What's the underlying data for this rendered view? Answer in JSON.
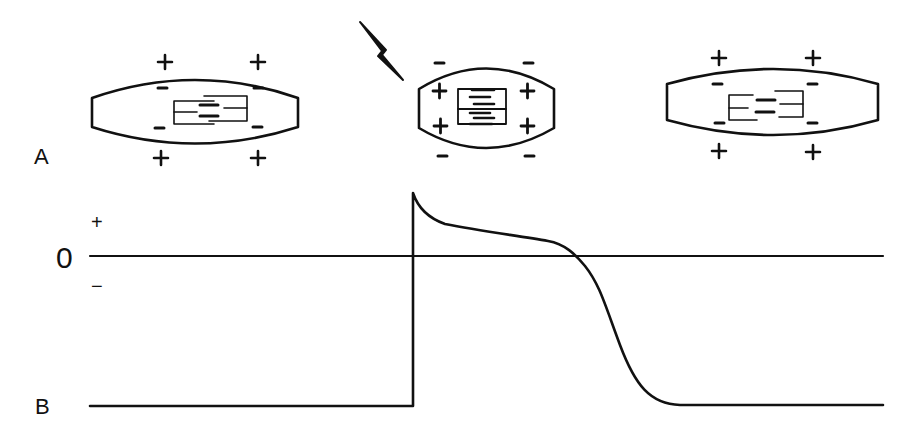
{
  "panels": {
    "a_label": "A",
    "b_label": "B"
  },
  "axis": {
    "zero_label": "0",
    "plus_label": "+",
    "minus_label": "−"
  },
  "cells": [
    {
      "state": "resting",
      "outside_charge": "+",
      "inside_charge": "−",
      "sarcomere": "relaxed"
    },
    {
      "state": "depolarized",
      "outside_charge": "−",
      "inside_charge": "+",
      "sarcomere": "contracted",
      "stimulus": "lightning-bolt"
    },
    {
      "state": "repolarized",
      "outside_charge": "+",
      "inside_charge": "−",
      "sarcomere": "relaxed"
    }
  ],
  "colors": {
    "ink": "#111111",
    "background": "#ffffff"
  },
  "trace": {
    "description": "Action potential: resting baseline, rapid upstroke at stimulus, overshoot spike, plateau, repolarization back to baseline"
  }
}
